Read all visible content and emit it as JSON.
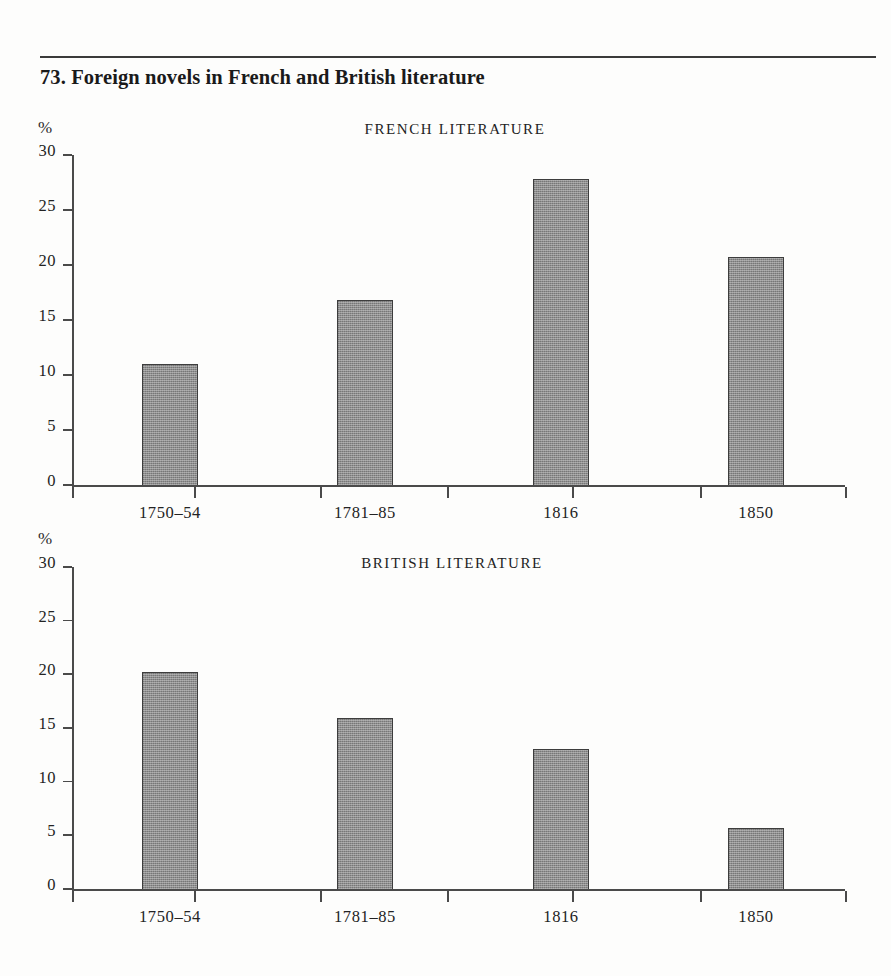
{
  "figure": {
    "number": "73.",
    "title": "73.  Foreign novels in French and British literature"
  },
  "panels": [
    {
      "id": "french",
      "heading": "FRENCH LITERATURE",
      "unit_label": "%"
    },
    {
      "id": "british",
      "heading": "BRITISH LITERATURE",
      "unit_label": "%"
    }
  ],
  "axis": {
    "y_ticks": [
      "0",
      "5",
      "10",
      "15",
      "20",
      "25",
      "30"
    ],
    "x_categories": [
      "1750–54",
      "1781–85",
      "1816",
      "1850"
    ]
  },
  "colors": {
    "bar_fill": "#8e8e8e",
    "bar_stroke": "#3d3d3d",
    "axis": "#4a4a4a",
    "text": "#232323",
    "rule": "#3a3a3a",
    "page_background": "#fdfdfc"
  },
  "chart_data": [
    {
      "type": "bar",
      "title": "FRENCH LITERATURE",
      "subtitle": "73.  Foreign novels in French and British literature",
      "xlabel": "",
      "ylabel": "%",
      "categories": [
        "1750–54",
        "1781–85",
        "1816",
        "1850"
      ],
      "values": [
        11.0,
        16.8,
        27.8,
        20.7
      ],
      "ylim": [
        0,
        30
      ],
      "yticks": [
        0,
        5,
        10,
        15,
        20,
        25,
        30
      ],
      "grid": false,
      "legend": false
    },
    {
      "type": "bar",
      "title": "BRITISH LITERATURE",
      "subtitle": "73.  Foreign novels in French and British literature",
      "xlabel": "",
      "ylabel": "%",
      "categories": [
        "1750–54",
        "1781–85",
        "1816",
        "1850"
      ],
      "values": [
        20.2,
        15.9,
        13.0,
        5.7
      ],
      "ylim": [
        0,
        30
      ],
      "yticks": [
        0,
        5,
        10,
        15,
        20,
        25,
        30
      ],
      "grid": false,
      "legend": false
    }
  ]
}
